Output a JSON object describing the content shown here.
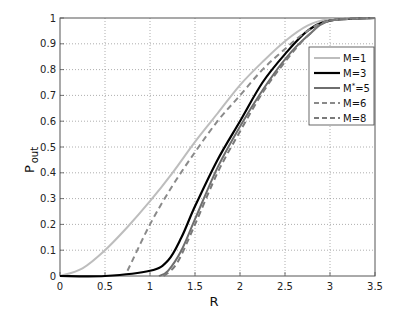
{
  "chart_data": {
    "type": "line",
    "title": "",
    "xlabel": "R",
    "ylabel": "P",
    "ylabel_sub": "out",
    "xlim": [
      0,
      3.5
    ],
    "ylim": [
      0,
      1
    ],
    "xticks": [
      "0",
      "0.5",
      "1",
      "1.5",
      "2",
      "2.5",
      "3",
      "3.5"
    ],
    "yticks": [
      "0",
      "0.1",
      "0.2",
      "0.3",
      "0.4",
      "0.5",
      "0.6",
      "0.7",
      "0.8",
      "0.9",
      "1"
    ],
    "grid": true,
    "legend_position": "upper right (inside)",
    "series": [
      {
        "name": "M=1",
        "label_main": "M=1",
        "color": "#bdbdbd",
        "dash": false,
        "width": 2,
        "x": [
          0,
          0.25,
          0.5,
          0.75,
          1,
          1.25,
          1.5,
          1.75,
          2,
          2.25,
          2.5,
          2.75,
          3,
          3.5
        ],
        "y": [
          0,
          0.03,
          0.1,
          0.19,
          0.29,
          0.4,
          0.52,
          0.63,
          0.74,
          0.83,
          0.91,
          0.97,
          0.995,
          1
        ]
      },
      {
        "name": "M=3",
        "label_main": "M=3",
        "color": "#000000",
        "dash": false,
        "width": 2.2,
        "x": [
          0,
          0.5,
          1,
          1.2,
          1.35,
          1.5,
          1.75,
          2,
          2.25,
          2.5,
          2.75,
          3,
          3.5
        ],
        "y": [
          0,
          0,
          0.02,
          0.06,
          0.15,
          0.27,
          0.45,
          0.6,
          0.75,
          0.86,
          0.95,
          0.99,
          1
        ]
      },
      {
        "name": "M*=5",
        "label_main": "M",
        "label_sup": "*",
        "label_tail": "=5",
        "color": "#6e6e6e",
        "dash": false,
        "width": 2,
        "x": [
          1.1,
          1.2,
          1.35,
          1.5,
          1.75,
          2,
          2.25,
          2.5,
          2.75,
          3,
          3.5
        ],
        "y": [
          0,
          0.02,
          0.1,
          0.22,
          0.42,
          0.58,
          0.72,
          0.84,
          0.93,
          0.99,
          1
        ]
      },
      {
        "name": "M=6",
        "label_main": "M=6",
        "color": "#8a8a8a",
        "dash": true,
        "width": 2,
        "x": [
          0.75,
          1,
          1.25,
          1.5,
          1.75,
          2,
          2.25,
          2.5,
          2.75,
          3,
          3.5
        ],
        "y": [
          0.02,
          0.2,
          0.35,
          0.48,
          0.6,
          0.7,
          0.8,
          0.88,
          0.95,
          0.99,
          1
        ]
      },
      {
        "name": "M=8",
        "label_main": "M=8",
        "color": "#7a7a7a",
        "dash": true,
        "width": 2,
        "x": [
          1.15,
          1.3,
          1.5,
          1.75,
          2,
          2.25,
          2.5,
          2.75,
          3,
          3.5
        ],
        "y": [
          0,
          0.05,
          0.2,
          0.4,
          0.56,
          0.71,
          0.83,
          0.93,
          0.99,
          1
        ]
      }
    ]
  }
}
